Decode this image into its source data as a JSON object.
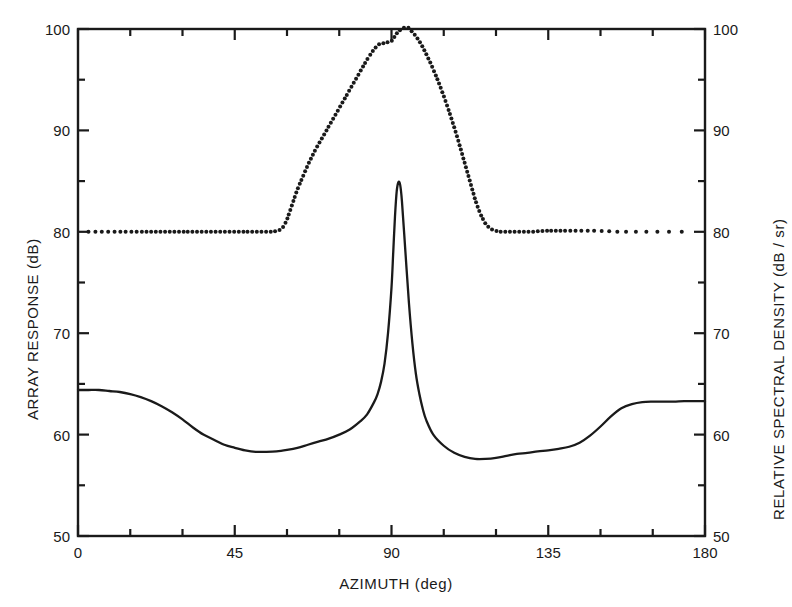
{
  "chart_data": {
    "type": "line",
    "title": "",
    "xlabel": "AZIMUTH (deg)",
    "ylabel": "ARRAY RESPONSE (dB)",
    "y2label": "RELATIVE SPECTRAL DENSITY (dB / sr)",
    "xlim": [
      0,
      180
    ],
    "ylim": [
      50,
      100
    ],
    "y2lim": [
      50,
      100
    ],
    "xticks": [
      0,
      45,
      90,
      135,
      180
    ],
    "xticklabels": [
      "0",
      "45",
      "90",
      "135",
      "180"
    ],
    "xminorticks": [
      15,
      30,
      60,
      75,
      105,
      120,
      150,
      165
    ],
    "yticks": [
      50,
      60,
      70,
      80,
      90,
      100
    ],
    "yticklabels": [
      "50",
      "60",
      "70",
      "80",
      "90",
      "100"
    ],
    "yminorticks": [
      55,
      65,
      75,
      85,
      95
    ],
    "y2ticks": [
      50,
      60,
      70,
      80,
      90,
      100
    ],
    "y2ticklabels": [
      "50",
      "60",
      "70",
      "80",
      "90",
      "100"
    ],
    "grid": false,
    "legend": "none",
    "frame": "box",
    "series": [
      {
        "name": "ARRAY RESPONSE",
        "style": "solid",
        "axis": "left",
        "x": [
          0,
          3,
          6,
          9,
          12,
          15,
          18,
          21,
          24,
          27,
          30,
          33,
          36,
          39,
          42,
          45,
          48,
          51,
          54,
          57,
          60,
          63,
          66,
          69,
          72,
          75,
          78,
          81,
          83,
          85,
          86,
          87,
          88,
          89,
          90,
          90.5,
          91,
          91.5,
          92,
          92.5,
          93,
          94,
          95,
          96,
          97,
          98,
          99,
          100,
          102,
          105,
          108,
          111,
          114,
          117,
          120,
          123,
          126,
          129,
          132,
          135,
          138,
          141,
          144,
          147,
          150,
          153,
          156,
          159,
          162,
          165,
          168,
          171,
          174,
          177,
          180
        ],
        "y": [
          64.4,
          64.4,
          64.4,
          64.3,
          64.2,
          64.0,
          63.7,
          63.3,
          62.8,
          62.2,
          61.5,
          60.7,
          60.0,
          59.5,
          59.0,
          58.7,
          58.45,
          58.3,
          58.3,
          58.35,
          58.5,
          58.7,
          59.0,
          59.3,
          59.6,
          60.0,
          60.5,
          61.3,
          62.0,
          63.2,
          64.0,
          65.2,
          67.0,
          70.0,
          74.5,
          78.0,
          81.5,
          84.0,
          84.9,
          84.6,
          83.0,
          78.0,
          73.0,
          69.0,
          66.0,
          64.0,
          62.5,
          61.4,
          60.0,
          58.9,
          58.2,
          57.8,
          57.6,
          57.6,
          57.7,
          57.9,
          58.1,
          58.2,
          58.35,
          58.45,
          58.6,
          58.8,
          59.2,
          59.9,
          60.8,
          61.8,
          62.6,
          63.0,
          63.2,
          63.25,
          63.25,
          63.25,
          63.3,
          63.3,
          63.3
        ]
      },
      {
        "name": "RELATIVE SPECTRAL DENSITY",
        "style": "dotted",
        "axis": "right",
        "x": [
          3,
          6,
          9,
          12,
          15,
          18,
          21,
          24,
          27,
          30,
          33,
          36,
          39,
          42,
          45,
          47,
          49,
          51,
          53,
          55,
          56,
          57,
          58,
          59,
          60,
          61,
          62,
          63,
          64,
          65,
          66,
          67,
          68,
          69,
          70,
          71,
          72,
          73,
          74,
          75,
          76,
          77,
          78,
          79,
          80,
          81,
          82,
          83,
          84,
          85,
          86,
          87,
          88,
          89,
          90,
          91,
          92,
          93,
          94,
          95,
          96,
          97,
          98,
          99,
          100,
          101,
          102,
          103,
          104,
          105,
          106,
          107,
          108,
          109,
          110,
          111,
          112,
          113,
          114,
          115,
          116,
          117,
          118,
          119,
          120,
          121,
          122,
          123,
          124,
          125,
          126,
          128,
          130,
          132,
          134,
          136,
          138,
          140,
          143,
          146,
          149,
          152,
          156,
          160,
          164,
          168,
          172,
          176
        ],
        "y": [
          80.0,
          80.0,
          80.0,
          80.0,
          80.0,
          80.0,
          80.0,
          80.0,
          80.0,
          80.0,
          80.0,
          80.0,
          80.0,
          80.0,
          80.0,
          80.0,
          80.0,
          80.0,
          80.0,
          80.0,
          80.0,
          80.1,
          80.2,
          80.5,
          81.2,
          82.2,
          83.2,
          84.2,
          85.0,
          85.8,
          86.6,
          87.3,
          88.0,
          88.6,
          89.2,
          89.8,
          90.4,
          91.0,
          91.6,
          92.2,
          92.8,
          93.4,
          94.0,
          94.6,
          95.2,
          95.8,
          96.4,
          97.0,
          97.5,
          98.0,
          98.4,
          98.6,
          98.6,
          98.7,
          98.8,
          99.3,
          99.8,
          100.0,
          100.2,
          100.1,
          99.7,
          99.3,
          98.8,
          98.2,
          97.5,
          96.8,
          96.0,
          95.2,
          94.3,
          93.4,
          92.4,
          91.4,
          90.3,
          89.2,
          88.0,
          86.8,
          85.6,
          84.4,
          83.2,
          82.2,
          81.4,
          80.8,
          80.4,
          80.2,
          80.1,
          80.0,
          80.0,
          80.0,
          80.0,
          80.0,
          80.0,
          80.0,
          80.0,
          80.05,
          80.1,
          80.1,
          80.1,
          80.1,
          80.1,
          80.1,
          80.1,
          80.05,
          80.0,
          80.0,
          80.0,
          80.0,
          80.0,
          80.0
        ]
      }
    ]
  },
  "axes": {
    "x_title": "AZIMUTH (deg)",
    "y_left_title": "ARRAY RESPONSE (dB)",
    "y_right_title": "RELATIVE SPECTRAL DENSITY (dB / sr)"
  },
  "colors": {
    "line": "#1a1a1a",
    "axis": "#1a1a1a",
    "background": "#ffffff"
  }
}
